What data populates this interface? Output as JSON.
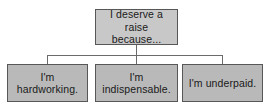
{
  "diagram": {
    "type": "org-chart",
    "title_text": "I deserve a raise because...",
    "root": {
      "id": "root",
      "line1": "I deserve a",
      "line2": "raise because...",
      "fill_color": "#c8c8c8",
      "border_color": "#575757"
    },
    "leaves": [
      {
        "id": "leaf-0",
        "line1": "I'm",
        "line2": "hardworking.",
        "fill_color": "#b9b9b9",
        "border_color": "#575757"
      },
      {
        "id": "leaf-1",
        "line1": "I'm",
        "line2": "indispensable.",
        "fill_color": "#b9b9b9",
        "border_color": "#575757"
      },
      {
        "id": "leaf-2",
        "line1": "I'm underpaid.",
        "line2": "",
        "fill_color": "#b9b9b9",
        "border_color": "#575757"
      }
    ],
    "connector_color": "#6b6b6b",
    "background_color": "#ffffff"
  }
}
